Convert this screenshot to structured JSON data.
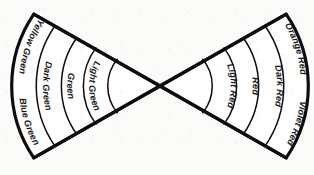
{
  "diagram": {
    "stroke_color": "#0d0d0f",
    "fill_color": "#ffffff",
    "background_color": "#fbfbf9",
    "center": {
      "x": 160,
      "y": 86
    },
    "fans": [
      {
        "name": "green-fan",
        "side": "left",
        "bands": [
          {
            "id": "light-green",
            "label": "Light Green"
          },
          {
            "id": "green",
            "label": "Green"
          },
          {
            "id": "dark-green",
            "label": "Dark Green"
          },
          {
            "id": "yellow-green",
            "label": "Yellow Green"
          },
          {
            "id": "blue-green",
            "label": "Blue Green"
          }
        ]
      },
      {
        "name": "red-fan",
        "side": "right",
        "bands": [
          {
            "id": "light-red",
            "label": "Light Red"
          },
          {
            "id": "red",
            "label": "Red"
          },
          {
            "id": "dark-red",
            "label": "Dark Red"
          },
          {
            "id": "orange-red",
            "label": "Orange Red"
          },
          {
            "id": "violet-red",
            "label": "Violet Red"
          }
        ]
      }
    ]
  }
}
